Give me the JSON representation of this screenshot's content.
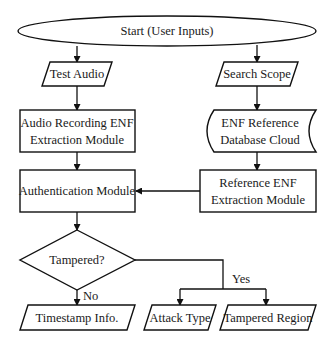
{
  "diagram": {
    "type": "flowchart",
    "nodes": {
      "start": {
        "label": "Start (User Inputs)",
        "shape": "ellipse"
      },
      "test_audio": {
        "label": "Test Audio",
        "shape": "parallelogram"
      },
      "search_scope": {
        "label": "Search Scope",
        "shape": "parallelogram"
      },
      "audio_enf": {
        "line1": "Audio Recording ENF",
        "line2": "Extraction Module",
        "shape": "rectangle"
      },
      "enf_db": {
        "line1": "ENF Reference",
        "line2": "Database Cloud",
        "shape": "stored-data"
      },
      "auth": {
        "label": "Authentication Module",
        "shape": "rectangle"
      },
      "ref_enf": {
        "line1": "Reference ENF",
        "line2": "Extraction Module",
        "shape": "rectangle"
      },
      "tampered": {
        "label": "Tampered?",
        "shape": "diamond"
      },
      "timestamp": {
        "label": "Timestamp Info.",
        "shape": "parallelogram"
      },
      "attack_type": {
        "label": "Attack Type",
        "shape": "parallelogram"
      },
      "tampered_region": {
        "label": "Tampered Region",
        "shape": "parallelogram"
      }
    },
    "edges": [
      {
        "from": "start",
        "to": "test_audio",
        "label": ""
      },
      {
        "from": "start",
        "to": "search_scope",
        "label": ""
      },
      {
        "from": "test_audio",
        "to": "audio_enf",
        "label": ""
      },
      {
        "from": "search_scope",
        "to": "enf_db",
        "label": ""
      },
      {
        "from": "audio_enf",
        "to": "auth",
        "label": ""
      },
      {
        "from": "enf_db",
        "to": "ref_enf",
        "label": ""
      },
      {
        "from": "ref_enf",
        "to": "auth",
        "label": ""
      },
      {
        "from": "auth",
        "to": "tampered",
        "label": ""
      },
      {
        "from": "tampered",
        "to": "timestamp",
        "label": "No"
      },
      {
        "from": "tampered",
        "to": "attack_type",
        "label": "Yes"
      },
      {
        "from": "tampered",
        "to": "tampered_region",
        "label": "Yes"
      }
    ],
    "edge_labels": {
      "no": "No",
      "yes": "Yes"
    }
  }
}
